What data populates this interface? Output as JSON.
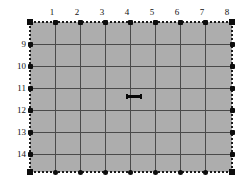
{
  "figure": {
    "kind": "grid-field-diagram",
    "background_color": "#ffffff",
    "field_fill_color": "#adadad",
    "grid_line_color": "#4a4a4a",
    "boundary_color": "#1a1a1a",
    "node_color": "#0d0d0d",
    "marker_color": "#080808"
  },
  "plot": {
    "left": 30,
    "top": 22,
    "width": 202,
    "height": 150,
    "columns": 8,
    "rows": 6
  },
  "axes": {
    "top": {
      "name": "column-axis",
      "labels": [
        "1",
        "2",
        "3",
        "4",
        "5",
        "6",
        "7",
        "8"
      ],
      "positions": [
        52,
        77,
        102,
        127,
        152,
        177,
        202,
        227
      ]
    },
    "left": {
      "name": "row-axis",
      "labels": [
        "9",
        "10",
        "11",
        "12",
        "13",
        "14"
      ],
      "positions": [
        44,
        66,
        88,
        110,
        132,
        154
      ]
    }
  },
  "grid": {
    "vertical_lines": [
      30,
      55,
      80,
      105,
      130,
      155,
      180,
      205,
      232
    ],
    "horizontal_lines": [
      22,
      44,
      66,
      88,
      110,
      132,
      154,
      172
    ]
  },
  "nodes": {
    "top_x": [
      55,
      80,
      105,
      130,
      155,
      180,
      205
    ],
    "bottom_x": [
      55,
      80,
      105,
      130,
      155,
      180,
      205
    ],
    "left_y": [
      44,
      66,
      88,
      110,
      132,
      154
    ],
    "right_y": [
      44,
      66,
      88,
      110,
      132,
      154
    ],
    "corners": [
      [
        30,
        22
      ],
      [
        232,
        22
      ],
      [
        30,
        172
      ],
      [
        232,
        172
      ]
    ]
  },
  "marker": {
    "name": "horizontal-scale-bar",
    "left": 126,
    "top": 95,
    "width": 16,
    "height": 3
  }
}
